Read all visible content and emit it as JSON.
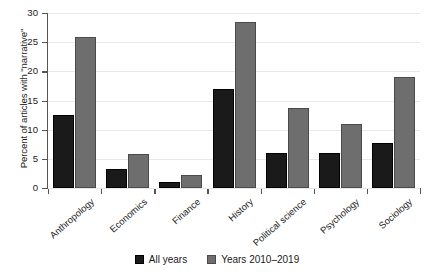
{
  "chart_data": {
    "type": "bar",
    "title": "",
    "xlabel": "",
    "ylabel": "Percent of articles with \"narrative\"",
    "ylim": [
      0,
      30
    ],
    "ytick_values": [
      0,
      5,
      10,
      15,
      20,
      25,
      30
    ],
    "ytick_labels": [
      "0",
      "5",
      "10",
      "15",
      "20",
      "25",
      "30"
    ],
    "grid": true,
    "legend_position": "bottom-center",
    "categories": [
      "Anthropology",
      "Economics",
      "Finance",
      "History",
      "Political science",
      "Psychology",
      "Sociology"
    ],
    "series": [
      {
        "name": "All years",
        "color": "#1a1a1a",
        "values": [
          12.5,
          3.2,
          1.0,
          16.9,
          6.0,
          6.0,
          7.7
        ]
      },
      {
        "name": "Years 2010–2019",
        "color": "#6e6e6e",
        "values": [
          25.9,
          5.8,
          2.3,
          28.4,
          13.7,
          11.0,
          19.0
        ]
      }
    ]
  },
  "legend": {
    "entries": [
      {
        "label": "All years"
      },
      {
        "label": "Years 2010–2019"
      }
    ]
  }
}
